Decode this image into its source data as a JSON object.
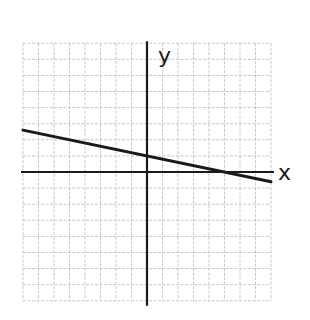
{
  "chart_data": {
    "type": "line",
    "title": "",
    "xlabel": "x",
    "ylabel": "y",
    "xlim": [
      -8,
      8
    ],
    "ylim": [
      -8,
      8
    ],
    "grid": true,
    "grid_step": 1,
    "tick_labels": false,
    "legend": null,
    "series": [
      {
        "name": "line",
        "equation": "y = -x/5 + 1",
        "slope": -0.2,
        "y_intercept": 1,
        "x_intercept": 5,
        "x": [
          -8,
          0,
          5,
          8
        ],
        "y": [
          2.6,
          1,
          0,
          -0.6
        ]
      }
    ]
  },
  "labels": {
    "x_axis": "x",
    "y_axis": "y"
  },
  "colors": {
    "grid": "#c8c8c8",
    "axis": "#1a1a1a",
    "line": "#1a1a1a",
    "background": "#ffffff"
  }
}
